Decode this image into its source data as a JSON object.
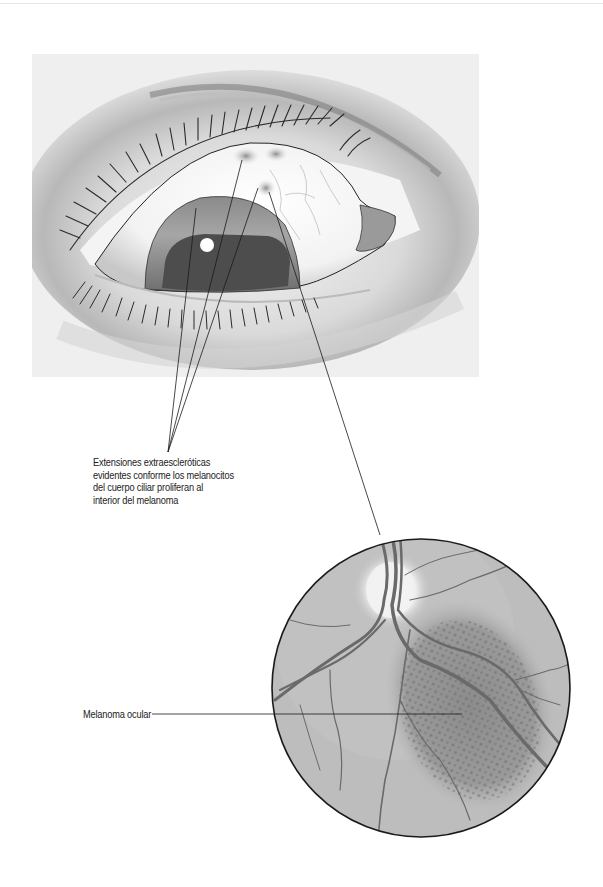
{
  "figure": {
    "eye_panel": {
      "description": "Close-up illustration of an eye showing extrascleral extensions near the upper limbus",
      "background": "#eeeeee"
    },
    "fundus_panel": {
      "description": "Circular fundus view showing optic disc, retinal vessels and pigmented ocular melanoma",
      "background": "#bdbdbd"
    }
  },
  "labels": {
    "extensions": {
      "lines": [
        "Extensiones extraescleróticas",
        "evidentes conforme los melanocitos",
        "del cuerpo ciliar proliferan al",
        "interior del melanoma"
      ]
    },
    "melanoma": {
      "text": "Melanoma ocular"
    }
  },
  "colors": {
    "line": "#1a1a1a",
    "text": "#222222",
    "vessel": "#6a6a6a",
    "melanoma": "#7a7a7a"
  }
}
